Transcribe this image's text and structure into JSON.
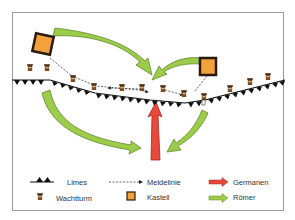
{
  "colors": {
    "roman_green": "#9ccc4a",
    "roman_green_stroke": "#5e8a2a",
    "german_red": "#e8493a",
    "german_red_stroke": "#9a2a20",
    "castle_orange": "#f2a23a",
    "castle_stroke": "#2a1a10",
    "limes_black": "#111111",
    "tower_brown": "#7a4a22",
    "frame": "#9a9a9a"
  },
  "legend": {
    "limes": "Limes",
    "meldelinie": "Meldelinie",
    "germanen": "Germanen",
    "wachtturm": "Wachtturm",
    "kastell": "Kastell",
    "roemer": "Römer"
  },
  "map": {
    "kastelle": [
      {
        "id": "kastell-west",
        "x": 43,
        "y": 44
      },
      {
        "id": "kastell-east",
        "x": 208,
        "y": 66
      }
    ],
    "arrows": [
      {
        "id": "roemer-west-to-limes",
        "type": "roemer"
      },
      {
        "id": "roemer-east-to-limes",
        "type": "roemer"
      },
      {
        "id": "roemer-west-behind-limes",
        "type": "roemer"
      },
      {
        "id": "roemer-east-behind-limes",
        "type": "roemer"
      },
      {
        "id": "germanen-breakthrough",
        "type": "germanen"
      }
    ]
  }
}
